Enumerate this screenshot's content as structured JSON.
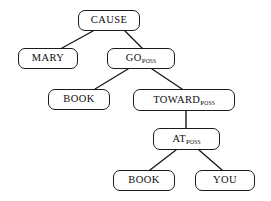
{
  "diagram": {
    "type": "tree",
    "canvas": {
      "width": 271,
      "height": 201,
      "background": "#ffffff"
    },
    "style": {
      "border_color": "#1a1a1a",
      "node_fill": "#ffffff",
      "edge_color": "#1a1a1a"
    },
    "nodes": [
      {
        "id": "cause",
        "label": "CAUSE",
        "subscript": "",
        "x": 78,
        "y": 10,
        "w": 62,
        "h": 21
      },
      {
        "id": "mary",
        "label": "MARY",
        "subscript": "",
        "x": 18,
        "y": 48,
        "w": 60,
        "h": 21
      },
      {
        "id": "go-poss",
        "label": "GO",
        "subscript": "Poss",
        "x": 107,
        "y": 48,
        "w": 68,
        "h": 21
      },
      {
        "id": "book-mid",
        "label": "BOOK",
        "subscript": "",
        "x": 48,
        "y": 89,
        "w": 62,
        "h": 21
      },
      {
        "id": "toward-poss",
        "label": "TOWARD",
        "subscript": "Poss",
        "x": 133,
        "y": 89,
        "w": 102,
        "h": 22
      },
      {
        "id": "at-poss",
        "label": "AT",
        "subscript": "Poss",
        "x": 153,
        "y": 128,
        "w": 67,
        "h": 22
      },
      {
        "id": "book-bottom",
        "label": "BOOK",
        "subscript": "",
        "x": 113,
        "y": 170,
        "w": 62,
        "h": 21
      },
      {
        "id": "you",
        "label": "YOU",
        "subscript": "",
        "x": 195,
        "y": 170,
        "w": 60,
        "h": 21
      }
    ],
    "edges": [
      {
        "id": "cause-mary",
        "from": "cause",
        "to": "mary",
        "x1": 93,
        "y1": 31,
        "x2": 62,
        "y2": 48
      },
      {
        "id": "cause-go",
        "from": "cause",
        "to": "go-poss",
        "x1": 125,
        "y1": 31,
        "x2": 142,
        "y2": 48
      },
      {
        "id": "go-book",
        "from": "go-poss",
        "to": "book-mid",
        "x1": 128,
        "y1": 69,
        "x2": 95,
        "y2": 89
      },
      {
        "id": "go-toward",
        "from": "go-poss",
        "to": "toward-poss",
        "x1": 152,
        "y1": 69,
        "x2": 182,
        "y2": 89
      },
      {
        "id": "toward-at",
        "from": "toward-poss",
        "to": "at-poss",
        "x1": 186,
        "y1": 111,
        "x2": 186,
        "y2": 128
      },
      {
        "id": "at-book",
        "from": "at-poss",
        "to": "book-bottom",
        "x1": 176,
        "y1": 150,
        "x2": 150,
        "y2": 170
      },
      {
        "id": "at-you",
        "from": "at-poss",
        "to": "you",
        "x1": 199,
        "y1": 150,
        "x2": 222,
        "y2": 170
      }
    ]
  }
}
